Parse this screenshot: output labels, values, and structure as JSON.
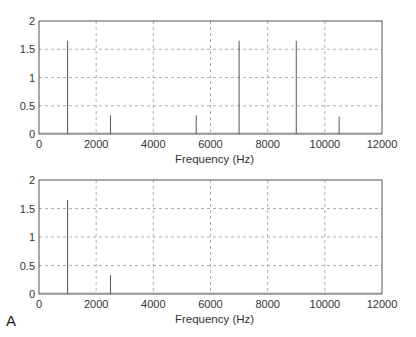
{
  "figure": {
    "panel_label": "A"
  },
  "chart_data": [
    {
      "type": "bar",
      "subtype": "stem-spectrum",
      "title": "",
      "xlabel": "Frequency (Hz)",
      "ylabel": "",
      "xlim": [
        0,
        12000
      ],
      "ylim": [
        0,
        2
      ],
      "xticks": [
        0,
        2000,
        4000,
        6000,
        8000,
        10000,
        12000
      ],
      "yticks": [
        0,
        0.5,
        1,
        1.5,
        2
      ],
      "xtick_labels": [
        "0",
        "2000",
        "4000",
        "6000",
        "8000",
        "10000",
        "12000"
      ],
      "ytick_labels": [
        "0",
        "0.5",
        "1",
        "1.5",
        "2"
      ],
      "grid": true,
      "legend": null,
      "x": [
        1000,
        2500,
        5500,
        7000,
        9000,
        10500
      ],
      "values": [
        1.65,
        0.33,
        0.33,
        1.65,
        1.65,
        0.31
      ]
    },
    {
      "type": "bar",
      "subtype": "stem-spectrum",
      "title": "",
      "xlabel": "Frequency (Hz)",
      "ylabel": "",
      "xlim": [
        0,
        12000
      ],
      "ylim": [
        0,
        2
      ],
      "xticks": [
        0,
        2000,
        4000,
        6000,
        8000,
        10000,
        12000
      ],
      "yticks": [
        0,
        0.5,
        1,
        1.5,
        2
      ],
      "xtick_labels": [
        "0",
        "2000",
        "4000",
        "6000",
        "8000",
        "10000",
        "12000"
      ],
      "ytick_labels": [
        "0",
        "0.5",
        "1",
        "1.5",
        "2"
      ],
      "grid": true,
      "legend": null,
      "x": [
        1000,
        2500
      ],
      "values": [
        1.65,
        0.33
      ]
    }
  ],
  "style": {
    "axis_color": "#555555",
    "grid_color": "#9a9a9a",
    "stem_color": "#555555"
  }
}
